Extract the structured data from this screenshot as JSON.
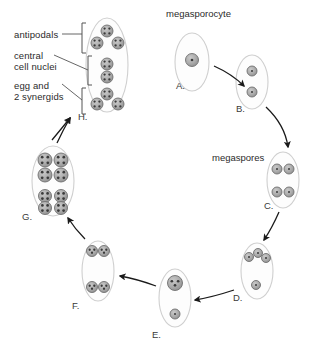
{
  "diagram": {
    "title_labels": [
      {
        "id": "megasporocyte",
        "text": "megasporocyte",
        "x": 166,
        "y": 8
      },
      {
        "id": "megaspores",
        "text": "megaspores",
        "x": 212,
        "y": 152
      }
    ],
    "callout_labels": [
      {
        "id": "antipodals",
        "text": "antipodals",
        "x": 14,
        "y": 29
      },
      {
        "id": "central",
        "text": "central",
        "x": 14,
        "y": 50
      },
      {
        "id": "cell-nuclei",
        "text": "cell nuclei",
        "x": 14,
        "y": 61
      },
      {
        "id": "egg-and",
        "text": "egg and",
        "x": 14,
        "y": 80
      },
      {
        "id": "two-synergids",
        "text": "2 synergids",
        "x": 14,
        "y": 91
      }
    ],
    "stages": [
      {
        "id": "A",
        "label": "A.",
        "label_x": 176,
        "label_y": 80,
        "cx": 192,
        "cy": 62,
        "rx": 17,
        "ry": 29,
        "nuclei": [
          {
            "x": 192,
            "y": 60,
            "r": 6.5,
            "dots": 1,
            "style": "solid"
          }
        ],
        "description": "megasporocyte with single large nucleus"
      },
      {
        "id": "B",
        "label": "B.",
        "label_x": 236,
        "label_y": 103,
        "cx": 252,
        "cy": 82,
        "rx": 16,
        "ry": 27,
        "nuclei": [
          {
            "x": 252,
            "y": 71,
            "r": 5,
            "dots": 1,
            "style": "ring"
          },
          {
            "x": 252,
            "y": 92,
            "r": 5,
            "dots": 1,
            "style": "ring"
          }
        ],
        "description": "two nuclei after meiosis I"
      },
      {
        "id": "C",
        "label": "C.",
        "label_x": 264,
        "label_y": 200,
        "cx": 283,
        "cy": 180,
        "rx": 16,
        "ry": 28,
        "nuclei": [
          {
            "x": 277,
            "y": 169,
            "r": 5,
            "dots": 1,
            "style": "ring"
          },
          {
            "x": 289,
            "y": 169,
            "r": 5,
            "dots": 1,
            "style": "ring"
          },
          {
            "x": 277,
            "y": 192,
            "r": 5,
            "dots": 1,
            "style": "ring"
          },
          {
            "x": 289,
            "y": 192,
            "r": 5,
            "dots": 1,
            "style": "ring"
          }
        ],
        "description": "four megaspores"
      },
      {
        "id": "D",
        "label": "D.",
        "label_x": 233,
        "label_y": 292,
        "cx": 257,
        "cy": 271,
        "rx": 16,
        "ry": 28,
        "nuclei": [
          {
            "x": 249,
            "y": 257,
            "r": 4.5,
            "dots": 1,
            "style": "ring"
          },
          {
            "x": 258,
            "y": 253,
            "r": 4.5,
            "dots": 1,
            "style": "ring"
          },
          {
            "x": 266,
            "y": 258,
            "r": 4.5,
            "dots": 1,
            "style": "ring"
          },
          {
            "x": 256,
            "y": 285,
            "r": 4.5,
            "dots": 1,
            "style": "ring"
          }
        ],
        "description": "three degenerating megaspores and one functional"
      },
      {
        "id": "E",
        "label": "E.",
        "label_x": 152,
        "label_y": 329,
        "cx": 175,
        "cy": 298,
        "rx": 16,
        "ry": 29,
        "nuclei": [
          {
            "x": 175,
            "y": 283,
            "r": 7.5,
            "dots": 3,
            "style": "solid"
          },
          {
            "x": 175,
            "y": 314,
            "r": 5,
            "dots": 1,
            "style": "ring"
          }
        ],
        "description": "functional megaspore enlarging"
      },
      {
        "id": "F",
        "label": "F.",
        "label_x": 72,
        "label_y": 300,
        "cx": 98,
        "cy": 271,
        "rx": 16,
        "ry": 30,
        "nuclei": [
          {
            "x": 92,
            "y": 251,
            "r": 5.5,
            "dots": 3,
            "style": "solid"
          },
          {
            "x": 104,
            "y": 251,
            "r": 5.5,
            "dots": 3,
            "style": "solid"
          },
          {
            "x": 92,
            "y": 287,
            "r": 5.5,
            "dots": 3,
            "style": "solid"
          },
          {
            "x": 104,
            "y": 287,
            "r": 5.5,
            "dots": 3,
            "style": "solid"
          }
        ],
        "description": "two-nucleate to four-nucleate embryo sac"
      },
      {
        "id": "G",
        "label": "G.",
        "label_x": 22,
        "label_y": 211,
        "cx": 53,
        "cy": 181,
        "rx": 21,
        "ry": 35,
        "nuclei": [
          {
            "x": 45,
            "y": 160,
            "r": 7,
            "dots": 4,
            "style": "solid"
          },
          {
            "x": 61,
            "y": 160,
            "r": 7,
            "dots": 4,
            "style": "solid"
          },
          {
            "x": 45,
            "y": 175,
            "r": 7,
            "dots": 4,
            "style": "solid"
          },
          {
            "x": 61,
            "y": 175,
            "r": 7,
            "dots": 4,
            "style": "solid"
          },
          {
            "x": 45,
            "y": 196,
            "r": 6.5,
            "dots": 4,
            "style": "solid"
          },
          {
            "x": 61,
            "y": 196,
            "r": 6.5,
            "dots": 4,
            "style": "solid"
          },
          {
            "x": 45,
            "y": 208,
            "r": 6.5,
            "dots": 4,
            "style": "solid"
          },
          {
            "x": 61,
            "y": 208,
            "r": 6.5,
            "dots": 4,
            "style": "solid"
          }
        ],
        "description": "eight-nucleate embryo sac"
      },
      {
        "id": "H",
        "label": "H.",
        "label_x": 78,
        "label_y": 111,
        "cx": 107,
        "cy": 65,
        "rx": 21,
        "ry": 47,
        "nuclei": [
          {
            "x": 107,
            "y": 31,
            "r": 6,
            "dots": 4,
            "style": "solid"
          },
          {
            "x": 97,
            "y": 43,
            "r": 6,
            "dots": 4,
            "style": "solid"
          },
          {
            "x": 118,
            "y": 43,
            "r": 6,
            "dots": 4,
            "style": "solid"
          },
          {
            "x": 107,
            "y": 64,
            "r": 6,
            "dots": 4,
            "style": "solid"
          },
          {
            "x": 107,
            "y": 77,
            "r": 6,
            "dots": 4,
            "style": "solid"
          },
          {
            "x": 107,
            "y": 94,
            "r": 6,
            "dots": 4,
            "style": "solid"
          },
          {
            "x": 97,
            "y": 104,
            "r": 6,
            "dots": 4,
            "style": "solid"
          },
          {
            "x": 118,
            "y": 104,
            "r": 6,
            "dots": 4,
            "style": "solid"
          }
        ],
        "description": "mature embryo sac with antipodals, central cell nuclei, egg and synergids"
      }
    ],
    "brackets": [
      {
        "id": "antipodals-bracket",
        "x": 82,
        "y1": 23,
        "y2": 53
      },
      {
        "id": "central-cell-bracket",
        "x": 88,
        "y1": 56,
        "y2": 85
      },
      {
        "id": "egg-synergid-bracket",
        "x": 82,
        "y1": 88,
        "y2": 114
      }
    ],
    "leader_lines": [
      {
        "id": "antipodals-leader",
        "x1": 62,
        "y1": 34,
        "x2": 82,
        "y2": 34
      },
      {
        "id": "central-leader",
        "x1": 54,
        "y1": 55,
        "x2": 88,
        "y2": 70
      },
      {
        "id": "egg-leader",
        "x1": 62,
        "y1": 84,
        "x2": 82,
        "y2": 100
      }
    ],
    "arrows": [
      {
        "id": "arrow-a-to-b",
        "from": "A",
        "to": "B",
        "path": "M 214 66 Q 232 74 244 86"
      },
      {
        "id": "arrow-b-to-c",
        "from": "B",
        "to": "C",
        "path": "M 266 107 Q 285 125 288 147"
      },
      {
        "id": "arrow-c-to-d",
        "from": "C",
        "to": "D",
        "path": "M 279 212 Q 272 228 264 240"
      },
      {
        "id": "arrow-d-to-e",
        "from": "D",
        "to": "E",
        "path": "M 234 290 Q 213 297 195 300"
      },
      {
        "id": "arrow-e-to-f",
        "from": "E",
        "to": "F",
        "path": "M 156 286 Q 137 279 120 276"
      },
      {
        "id": "arrow-f-to-g",
        "from": "F",
        "to": "G",
        "path": "M 85 239 Q 75 229 68 218"
      },
      {
        "id": "arrow-g-to-h",
        "from": "G",
        "to": "H",
        "path": "M 57 143 Q 63 130 70 118"
      },
      {
        "id": "arrow-callout-to-h",
        "from": "callout",
        "to": "H",
        "path": "M 52 140 Q 62 128 70 118"
      }
    ],
    "colors": {
      "cell_outline": "#cfcfcf",
      "cell_fill": "#fdfdfd",
      "nucleus_fill": "#a8a8a8",
      "nucleus_stroke": "#6f6f6f",
      "nucleus_dot": "#3a3a3a",
      "text": "#2b2b2b",
      "arrow": "#1a1a1a",
      "bracket": "#555555",
      "background": "#ffffff"
    }
  }
}
